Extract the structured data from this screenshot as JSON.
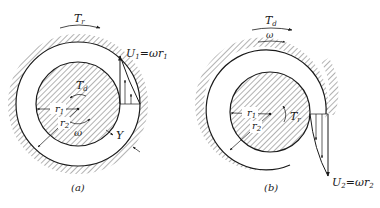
{
  "figure": {
    "panels": [
      {
        "id": "a",
        "caption": "(a)",
        "top_torque_label": "T",
        "top_torque_sub": "r",
        "inner_torque_label": "T",
        "inner_torque_sub": "d",
        "rotation_label": "ω",
        "r1_label": "r",
        "r1_sub": "1",
        "r2_label": "r",
        "r2_sub": "2",
        "gap_label": "Y",
        "velocity_label": "U",
        "velocity_sub": "1",
        "velocity_eq": "=ωr",
        "velocity_eq_sub": "1"
      },
      {
        "id": "b",
        "caption": "(b)",
        "top_torque_label": "T",
        "top_torque_sub": "d",
        "top_rotation_label": "ω",
        "inner_torque_label": "T",
        "inner_torque_sub": "r",
        "r1_label": "r",
        "r1_sub": "1",
        "r2_label": "r",
        "r2_sub": "2",
        "velocity_label": "U",
        "velocity_sub": "2",
        "velocity_eq": "=ωr",
        "velocity_eq_sub": "2"
      }
    ]
  },
  "colors": {
    "ink": "#1a1a1a",
    "hatch": "#555555",
    "background": "#ffffff"
  }
}
